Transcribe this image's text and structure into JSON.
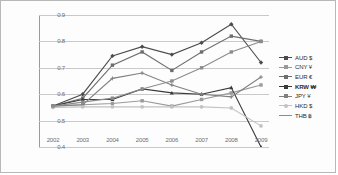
{
  "chart_data": {
    "type": "line",
    "title": "",
    "xlabel": "",
    "ylabel": "",
    "categories": [
      "2002",
      "2003",
      "2004",
      "2005",
      "2006",
      "2007",
      "2008",
      "2009"
    ],
    "ylim": [
      0.4,
      0.9
    ],
    "yticks": [
      "0.9",
      "0.8",
      "0.7",
      "0.6",
      "0.5",
      "0.4"
    ],
    "grid": true,
    "legend_position": "right",
    "series": [
      {
        "name": "AUD $",
        "symbol": "$",
        "color": "#4c4c4c",
        "marker": "diamond",
        "values": [
          0.555,
          0.6,
          0.745,
          0.78,
          0.75,
          0.795,
          0.865,
          0.72
        ]
      },
      {
        "name": "CNY ¥",
        "symbol": "¥",
        "color": "#9a9a9a",
        "marker": "square",
        "values": [
          0.555,
          0.56,
          0.565,
          0.575,
          0.555,
          0.58,
          0.605,
          0.635
        ]
      },
      {
        "name": "EUR €",
        "symbol": "€",
        "color": "#6e6e6e",
        "marker": "square",
        "values": [
          0.555,
          0.585,
          0.71,
          0.76,
          0.69,
          0.76,
          0.82,
          0.8
        ]
      },
      {
        "name": "KRW ₩",
        "symbol": "₩",
        "color": "#3a3a3a",
        "marker": "triangle",
        "values": [
          0.555,
          0.58,
          0.58,
          0.62,
          0.605,
          0.6,
          0.625,
          0.4
        ]
      },
      {
        "name": "JPY ¥",
        "symbol": "¥",
        "color": "#808080",
        "marker": "cross",
        "values": [
          0.555,
          0.56,
          0.66,
          0.68,
          0.635,
          0.6,
          0.59,
          0.665
        ]
      },
      {
        "name": "HKD $",
        "symbol": "$",
        "color": "#c2c2c2",
        "marker": "circle",
        "values": [
          0.55,
          0.552,
          0.552,
          0.552,
          0.552,
          0.552,
          0.548,
          0.48
        ]
      },
      {
        "name": "THB ฿",
        "symbol": "฿",
        "color": "#8c8c8c",
        "marker": "line",
        "values": [
          0.555,
          0.57,
          0.585,
          0.62,
          0.65,
          0.7,
          0.76,
          0.8
        ]
      }
    ]
  }
}
